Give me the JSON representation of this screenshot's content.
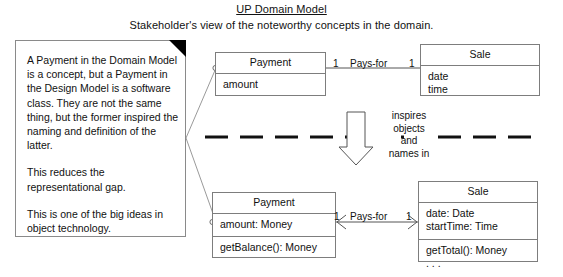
{
  "title": {
    "main": "UP Domain Model",
    "subtitle": "Stakeholder's view of the noteworthy concepts in the domain."
  },
  "note": {
    "paragraphs": [
      "A Payment in the Domain Model is a concept, but a Payment in the Design Model is a software class. They are not the same thing, but the former inspired the naming and definition of the latter.",
      "This reduces the representational gap.",
      "This is one of the big ideas in object technology."
    ]
  },
  "domain_layer": {
    "payment": {
      "name": "Payment",
      "attributes": [
        "amount"
      ]
    },
    "sale": {
      "name": "Sale",
      "attributes": [
        "date",
        "time"
      ]
    },
    "association": {
      "label": "Pays-for",
      "multiplicity_left": "1",
      "multiplicity_right": "1"
    }
  },
  "design_layer": {
    "payment": {
      "name": "Payment",
      "attributes": [
        "amount: Money"
      ],
      "operations": [
        "getBalance(): Money"
      ]
    },
    "sale": {
      "name": "Sale",
      "attributes": [
        "date: Date",
        "startTime: Time"
      ],
      "operations": [
        "getTotal(): Money",
        ". . ."
      ]
    },
    "association": {
      "label": "Pays-for",
      "multiplicity_left": "1",
      "multiplicity_right": "1"
    }
  },
  "transition": {
    "lines": [
      "inspires",
      "objects",
      "and",
      "names in"
    ]
  },
  "colors": {
    "ink": "#111111",
    "stroke": "#7d7d7d",
    "note_stroke": "#8a8a8a",
    "background": "#ffffff"
  }
}
